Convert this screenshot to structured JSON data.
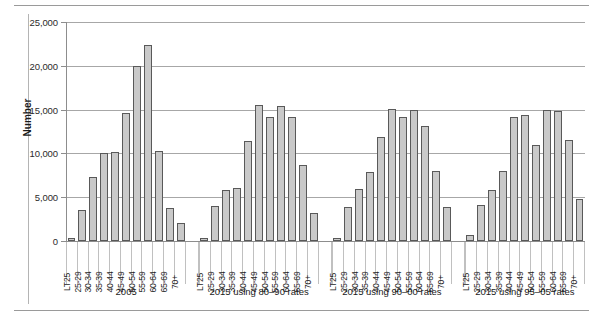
{
  "chart_data": {
    "type": "bar",
    "title": "",
    "xlabel": "",
    "ylabel": "Number",
    "ylim": [
      0,
      25000
    ],
    "ytick_step": 5000,
    "ytick_labels": [
      "25,000",
      "20,000",
      "15,000",
      "10,000",
      "5,000",
      "0"
    ],
    "ytick_values": [
      25000,
      20000,
      15000,
      10000,
      5000,
      0
    ],
    "grid": true,
    "legend": "none",
    "categories": [
      "LT25",
      "25-29",
      "30-34",
      "35-39",
      "40-44",
      "45-49",
      "50-54",
      "55-59",
      "60-64",
      "65-69",
      "70+"
    ],
    "group_labels": [
      "2005",
      "2015 using 80–90 rates",
      "2015 using 90–00 rates",
      "2015 using 95–05 rates"
    ],
    "series": [
      {
        "name": "2005",
        "values": [
          300,
          3500,
          7300,
          10000,
          10200,
          14600,
          20000,
          22400,
          10300,
          3800,
          2100
        ]
      },
      {
        "name": "2015 using 80–90 rates",
        "values": [
          300,
          4000,
          5800,
          6100,
          11400,
          15500,
          14200,
          15400,
          14100,
          8700,
          3200
        ]
      },
      {
        "name": "2015 using 90–00 rates",
        "values": [
          300,
          3900,
          5900,
          7900,
          11900,
          15100,
          14200,
          15000,
          13100,
          8000,
          3900
        ]
      },
      {
        "name": "2015 using 95–05 rates",
        "values": [
          700,
          4100,
          5800,
          8000,
          14100,
          14400,
          11000,
          15000,
          14800,
          11500,
          4800
        ]
      }
    ],
    "colors": {
      "bar_fill": "#c9c9c9",
      "bar_border": "#595959",
      "gridline": "#a7a7a7",
      "axis": "#8d8d8d",
      "text": "#1a1a1a"
    }
  }
}
